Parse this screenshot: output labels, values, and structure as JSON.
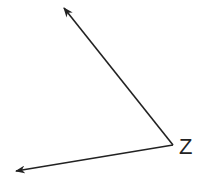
{
  "diagram": {
    "type": "angle",
    "vertex": {
      "label": "Z",
      "x": 173,
      "y": 145
    },
    "rays": [
      {
        "name": "upper-ray",
        "from": [
          173,
          145
        ],
        "to": [
          64,
          8
        ]
      },
      {
        "name": "lower-ray",
        "from": [
          173,
          145
        ],
        "to": [
          16,
          171
        ]
      }
    ],
    "colors": {
      "stroke": "#222222",
      "background": "#ffffff"
    }
  }
}
